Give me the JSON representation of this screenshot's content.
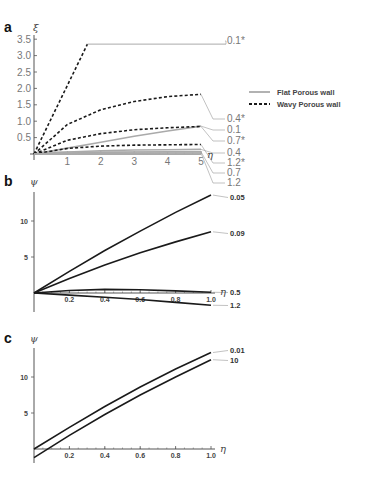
{
  "chart_data": [
    {
      "panel": "a",
      "type": "line",
      "xlabel": "η",
      "ylabel": "ξ",
      "xlim": [
        0,
        5
      ],
      "ylim": [
        0,
        3.5
      ],
      "xticks": [
        "1",
        "2",
        "3",
        "4",
        "5"
      ],
      "yticks": [
        "0.5",
        "1.0",
        "1.5",
        "2.0",
        "2.5",
        "3.0",
        "3.5"
      ],
      "legend": [
        {
          "label": "Flat Porous wall",
          "style": "solid-gray"
        },
        {
          "label": "Wavy Porous wall",
          "style": "dashed-black"
        }
      ],
      "legend_position": "right",
      "series": [
        {
          "name": "0.1*",
          "style": "dashed",
          "x": [
            0,
            1.6
          ],
          "y": [
            0,
            3.35
          ],
          "note": "plateau continues as thin gray line at 3.35"
        },
        {
          "name": "0.4*",
          "style": "dashed",
          "x": [
            0,
            1,
            2,
            3,
            4,
            5
          ],
          "y": [
            0,
            0.9,
            1.35,
            1.6,
            1.75,
            1.82
          ]
        },
        {
          "name": "0.1",
          "style": "solid",
          "x": [
            0,
            1,
            2,
            3,
            4,
            5
          ],
          "y": [
            0,
            0.18,
            0.36,
            0.54,
            0.7,
            0.85
          ]
        },
        {
          "name": "0.7*",
          "style": "dashed",
          "x": [
            0,
            1,
            2,
            3,
            4,
            5
          ],
          "y": [
            0,
            0.42,
            0.62,
            0.74,
            0.8,
            0.84
          ]
        },
        {
          "name": "0.4",
          "style": "solid",
          "x": [
            0,
            1,
            2,
            3,
            4,
            5
          ],
          "y": [
            0,
            0.06,
            0.1,
            0.12,
            0.13,
            0.14
          ]
        },
        {
          "name": "1.2*",
          "style": "dashed",
          "x": [
            0,
            1,
            2,
            3,
            4,
            5
          ],
          "y": [
            0,
            0.17,
            0.24,
            0.27,
            0.28,
            0.29
          ]
        },
        {
          "name": "0.7",
          "style": "solid",
          "x": [
            0,
            1,
            2,
            3,
            4,
            5
          ],
          "y": [
            0,
            0.03,
            0.05,
            0.06,
            0.07,
            0.07
          ]
        },
        {
          "name": "1.2",
          "style": "solid",
          "x": [
            0,
            1,
            2,
            3,
            4,
            5
          ],
          "y": [
            0,
            0.01,
            0.02,
            0.02,
            0.03,
            0.03
          ]
        }
      ]
    },
    {
      "panel": "b",
      "type": "line",
      "xlabel": "η",
      "ylabel": "ψ",
      "xlim": [
        0,
        1.0
      ],
      "ylim": [
        -2,
        15
      ],
      "xticks": [
        "0.2",
        "0.4",
        "0.6",
        "0.8",
        "1.0"
      ],
      "yticks": [
        "5",
        "10"
      ],
      "series": [
        {
          "name": "0.05",
          "x": [
            0,
            0.2,
            0.4,
            0.6,
            0.8,
            1.0
          ],
          "y": [
            0,
            3.0,
            5.9,
            8.6,
            11.2,
            13.6
          ]
        },
        {
          "name": "0.09",
          "x": [
            0,
            0.2,
            0.4,
            0.6,
            0.8,
            1.0
          ],
          "y": [
            0,
            2.0,
            3.9,
            5.6,
            7.1,
            8.5
          ]
        },
        {
          "name": "0.5",
          "x": [
            0,
            0.2,
            0.4,
            0.6,
            0.8,
            1.0
          ],
          "y": [
            0,
            0.35,
            0.5,
            0.45,
            0.3,
            0.1
          ]
        },
        {
          "name": "1.2",
          "x": [
            0,
            0.2,
            0.4,
            0.6,
            0.8,
            1.0
          ],
          "y": [
            0,
            -0.3,
            -0.6,
            -0.9,
            -1.3,
            -1.7
          ]
        }
      ]
    },
    {
      "panel": "c",
      "type": "line",
      "xlabel": "η",
      "ylabel": "ψ",
      "xlim": [
        0,
        1.0
      ],
      "ylim": [
        -2,
        15
      ],
      "xticks": [
        "0.2",
        "0.4",
        "0.6",
        "0.8",
        "1.0"
      ],
      "yticks": [
        "5",
        "10"
      ],
      "series": [
        {
          "name": "0.01",
          "x": [
            0,
            0.2,
            0.4,
            0.6,
            0.8,
            1.0
          ],
          "y": [
            0,
            3.0,
            5.9,
            8.6,
            11.1,
            13.4
          ]
        },
        {
          "name": "10",
          "x": [
            0,
            0.2,
            0.4,
            0.6,
            0.8,
            1.0
          ],
          "y": [
            -1.2,
            1.9,
            4.8,
            7.5,
            10.0,
            12.4
          ]
        }
      ]
    }
  ],
  "panels": {
    "a": {
      "letter": "a",
      "ylabel": "ξ",
      "xlabel": "η"
    },
    "b": {
      "letter": "b",
      "ylabel": "ψ",
      "xlabel": "η"
    },
    "c": {
      "letter": "c",
      "ylabel": "ψ",
      "xlabel": "η"
    }
  },
  "legend": {
    "flat": "Flat Porous wall",
    "wavy": "Wavy Porous wall"
  },
  "colors": {
    "axis": "#555555",
    "dashed": "#1a1a1a",
    "flat": "#aaaaaa",
    "curve_bc": "#1a1a1a",
    "leader": "#999999"
  }
}
